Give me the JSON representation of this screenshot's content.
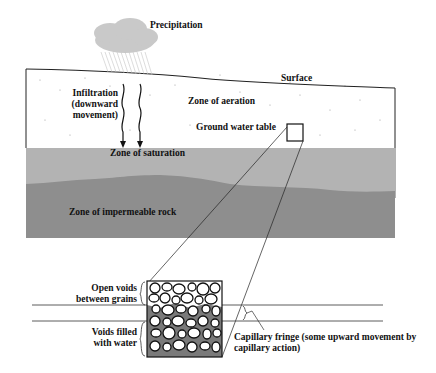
{
  "diagram": {
    "labels": {
      "precipitation": "Precipitation",
      "surface": "Surface",
      "infiltration_line1": "Infiltration",
      "infiltration_line2": "(downward",
      "infiltration_line3": "movement)",
      "zone_aeration": "Zone of aeration",
      "ground_water_table": "Ground water table",
      "zone_saturation": "Zone of saturation",
      "zone_impermeable": "Zone of impermeable rock",
      "open_voids_line1": "Open voids",
      "open_voids_line2": "between grains",
      "voids_filled_line1": "Voids filled",
      "voids_filled_line2": "with water",
      "capillary_line1": "Capillary fringe (some upward movement by",
      "capillary_line2": "capillary action)"
    },
    "colors": {
      "cloud": "#c9c9c9",
      "aeration": "#ffffff",
      "saturation": "#b3b3b3",
      "impermeable": "#8e8e8e",
      "line": "#222222",
      "water_fill": "#7a7a7a"
    }
  }
}
